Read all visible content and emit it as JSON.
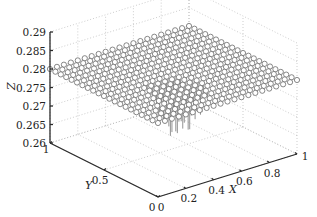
{
  "chart_data": {
    "type": "scatter3d_stem",
    "title": "",
    "xlabel": "X",
    "ylabel": "Y",
    "zlabel": "Z",
    "xlim": [
      0,
      1
    ],
    "ylim": [
      0,
      1
    ],
    "zlim": [
      0.26,
      0.29
    ],
    "x_ticks": [
      "0",
      "0.2",
      "0.4",
      "0.6",
      "0.8",
      "1"
    ],
    "y_ticks": [
      "0",
      "0.5",
      "1"
    ],
    "z_ticks": [
      "0.26",
      "0.265",
      "0.27",
      "0.275",
      "0.28",
      "0.285",
      "0.29"
    ],
    "grid": true,
    "grid_style": "dotted",
    "marker": "open-circle",
    "colors": {
      "marker": "#6a6a6a",
      "stem": "#777777",
      "axis": "#2a2a2a",
      "grid": "#b8b8b8"
    },
    "grid_points": {
      "nx": 21,
      "ny": 21,
      "x_range": [
        0,
        1
      ],
      "y_range": [
        0,
        1
      ]
    },
    "surface_description": "Regular 21x21 grid of points in X,Y ∈ [0,1]; Z ≈ 0.28 almost everywhere, with stem lines dropping down toward Z≈0.265 near the center region (X≈0.3–0.6, Y≈0.2–0.6).",
    "z_base_value": 0.28,
    "z_min_stem_value": 0.265
  }
}
